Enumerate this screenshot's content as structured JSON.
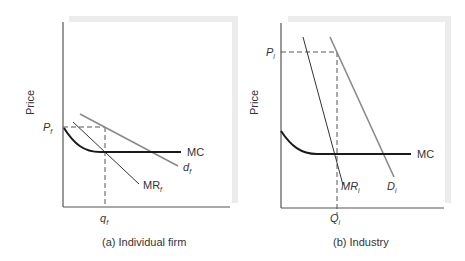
{
  "panels": [
    {
      "id": "a",
      "caption": "(a) Individual firm",
      "ylabel": "Price",
      "price_label": "P",
      "price_sub": "f",
      "qty_label": "q",
      "qty_sub": "f",
      "mc_label": "MC",
      "demand_label": "d",
      "demand_sub": "f",
      "mr_label": "MR",
      "mr_sub": "f"
    },
    {
      "id": "b",
      "caption": "(b) Industry",
      "ylabel": "Price",
      "price_label": "P",
      "price_sub": "i",
      "qty_label": "Q",
      "qty_sub": "i",
      "mc_label": "MC",
      "demand_label": "D",
      "demand_sub": "i",
      "mr_label": "MR",
      "mr_sub": "i"
    }
  ],
  "colors": {
    "axis": "#555555",
    "mc": "#1a1a1a",
    "demand": "#888888",
    "mr": "#333333",
    "shadow": "#ececec",
    "dashed": "#555555"
  }
}
